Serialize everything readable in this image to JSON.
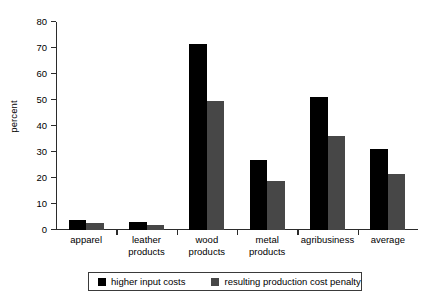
{
  "chart_data": {
    "type": "bar",
    "title": "",
    "xlabel": "",
    "ylabel": "percent",
    "ylim": [
      0,
      80
    ],
    "yticks": [
      0,
      10,
      20,
      30,
      40,
      50,
      60,
      70,
      80
    ],
    "grid": false,
    "legend_position": "bottom",
    "categories": [
      "apparel",
      "leather\nproducts",
      "wood\nproducts",
      "metal\nproducts",
      "agribusiness",
      "average"
    ],
    "series": [
      {
        "name": "higher input costs",
        "color": "#000000",
        "values": [
          4,
          3,
          71.5,
          27,
          51,
          31
        ]
      },
      {
        "name": "resulting production cost penalty",
        "color": "#474747",
        "values": [
          2.7,
          2,
          49.5,
          19,
          36,
          21.5
        ]
      }
    ]
  },
  "colors": {
    "axis": "#2b2b2b",
    "background": "#ffffff",
    "series_0": "#000000",
    "series_1": "#474747"
  }
}
